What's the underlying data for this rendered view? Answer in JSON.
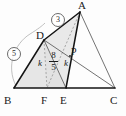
{
  "figure": {
    "type": "geometry-diagram",
    "background_color": "#fdfdfd",
    "shade_color": "#e4e4e4",
    "stroke_color": "#1a1a1a",
    "thin_stroke_color": "#5a5a5a",
    "dashed_stroke_color": "#8a8a8a",
    "arc_color": "#9a9a9a"
  },
  "vertices": [
    {
      "name": "A",
      "label": "A",
      "x": 80,
      "y": 12,
      "label_x": 78,
      "label_y": 0
    },
    {
      "name": "B",
      "label": "B",
      "x": 14,
      "y": 88,
      "label_x": 8,
      "label_y": 96
    },
    {
      "name": "C",
      "label": "C",
      "x": 115,
      "y": 88,
      "label_x": 112,
      "label_y": 96
    },
    {
      "name": "D",
      "label": "D",
      "x": 44,
      "y": 40,
      "label_x": 37,
      "label_y": 31
    },
    {
      "name": "P",
      "label": "P",
      "x": 70,
      "y": 56,
      "label_x": 72,
      "label_y": 49
    },
    {
      "name": "F",
      "label": "F",
      "x": 47,
      "y": 88,
      "label_x": 42,
      "label_y": 96
    },
    {
      "name": "E",
      "label": "E",
      "x": 66,
      "y": 88,
      "label_x": 61,
      "label_y": 96
    }
  ],
  "segment_labels": [
    {
      "name": "ratio-3-on-DA",
      "text": "3",
      "style": "circled",
      "x": 57,
      "y": 19
    },
    {
      "name": "ratio-5-on-BD",
      "text": "5",
      "style": "circled",
      "x": 13,
      "y": 53
    },
    {
      "name": "length-k-left",
      "text": "k",
      "style": "italic",
      "x": 40,
      "y": 63
    },
    {
      "name": "length-k-right",
      "text": "k",
      "style": "italic",
      "x": 65,
      "y": 63
    }
  ],
  "fraction_label": {
    "name": "length-eight-fifths",
    "numerator": "8",
    "denominator": "5",
    "x": 52,
    "y": 57
  },
  "shaded_regions": [
    {
      "name": "region-BDF",
      "points": "14,88 44,40 47,88"
    },
    {
      "name": "region-DFE",
      "points": "44,40 47,88 66,88"
    },
    {
      "name": "region-DEA",
      "points": "44,40 66,88 80,12"
    }
  ],
  "solid_lines": [
    {
      "name": "line-BC-base",
      "x1": 14,
      "y1": 88,
      "x2": 115,
      "y2": 88
    },
    {
      "name": "line-BD",
      "x1": 14,
      "y1": 88,
      "x2": 44,
      "y2": 40
    },
    {
      "name": "line-DA",
      "x1": 44,
      "y1": 40,
      "x2": 80,
      "y2": 12
    },
    {
      "name": "line-AE",
      "x1": 80,
      "y1": 12,
      "x2": 66,
      "y2": 88
    },
    {
      "name": "line-AC",
      "x1": 80,
      "y1": 12,
      "x2": 115,
      "y2": 88
    },
    {
      "name": "line-AB-upper",
      "x1": 80,
      "y1": 12,
      "x2": 14,
      "y2": 88
    },
    {
      "name": "line-DC",
      "x1": 44,
      "y1": 40,
      "x2": 115,
      "y2": 88
    },
    {
      "name": "line-DE",
      "x1": 44,
      "y1": 40,
      "x2": 66,
      "y2": 88
    }
  ],
  "dashed_lines": [
    {
      "name": "dashed-DF",
      "x1": 44,
      "y1": 40,
      "x2": 47,
      "y2": 88
    },
    {
      "name": "dashed-AF",
      "x1": 80,
      "y1": 12,
      "x2": 47,
      "y2": 88
    }
  ],
  "arc": {
    "name": "arc-measure-BD",
    "path": "M 16 86 C 6 66 14 44 30 34 C 38 29 42 26 45 23"
  }
}
